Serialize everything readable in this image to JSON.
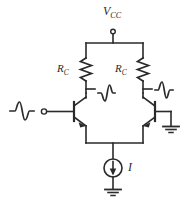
{
  "figure": {
    "type": "schematic",
    "background_color": "#ffffff",
    "line_color": "#2a2a2a"
  },
  "labels": {
    "supply": {
      "symbol": "V",
      "subscript": "CC"
    },
    "resistor_left": {
      "symbol": "R",
      "subscript": "C"
    },
    "resistor_right": {
      "symbol": "R",
      "subscript": "C"
    },
    "current_source": {
      "symbol": "I"
    }
  },
  "nodes": {
    "supply_terminal": "open-circle",
    "input_terminal": "filled-dot",
    "ground_right": "ground-symbol",
    "ground_bottom": "ground-symbol"
  },
  "waveforms": [
    {
      "name": "input-signal",
      "phase": "non-inverted",
      "location": "left-input"
    },
    {
      "name": "output-left",
      "phase": "inverted",
      "location": "left-collector"
    },
    {
      "name": "output-right",
      "phase": "non-inverted",
      "location": "right-collector"
    }
  ],
  "devices": [
    {
      "name": "transistor-left",
      "type": "npn",
      "orientation": "normal"
    },
    {
      "name": "transistor-right",
      "type": "npn",
      "orientation": "mirrored"
    },
    {
      "name": "resistor-left",
      "type": "zigzag"
    },
    {
      "name": "resistor-right",
      "type": "zigzag"
    },
    {
      "name": "current-source",
      "type": "circle-arrow-down"
    }
  ]
}
